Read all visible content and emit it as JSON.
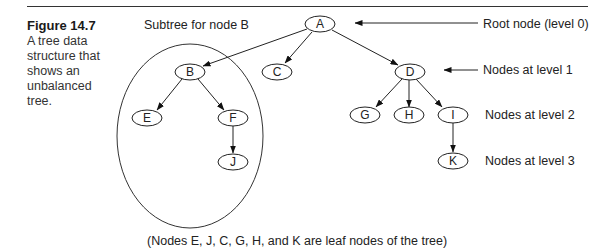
{
  "figure": {
    "number": "Figure 14.7",
    "caption": "A tree data structure that shows an unbalanced tree."
  },
  "diagram": {
    "subtree_label": "Subtree for node B",
    "nodes": [
      {
        "id": "A",
        "label": "A",
        "level": 0
      },
      {
        "id": "B",
        "label": "B",
        "level": 1
      },
      {
        "id": "C",
        "label": "C",
        "level": 1
      },
      {
        "id": "D",
        "label": "D",
        "level": 1
      },
      {
        "id": "E",
        "label": "E",
        "level": 2
      },
      {
        "id": "F",
        "label": "F",
        "level": 2
      },
      {
        "id": "G",
        "label": "G",
        "level": 2
      },
      {
        "id": "H",
        "label": "H",
        "level": 2
      },
      {
        "id": "I",
        "label": "I",
        "level": 2
      },
      {
        "id": "J",
        "label": "J",
        "level": 3
      },
      {
        "id": "K",
        "label": "K",
        "level": 3
      }
    ],
    "edges": [
      [
        "A",
        "B"
      ],
      [
        "A",
        "C"
      ],
      [
        "A",
        "D"
      ],
      [
        "B",
        "E"
      ],
      [
        "B",
        "F"
      ],
      [
        "F",
        "J"
      ],
      [
        "D",
        "G"
      ],
      [
        "D",
        "H"
      ],
      [
        "D",
        "I"
      ],
      [
        "I",
        "K"
      ]
    ],
    "level_labels": {
      "root": "Root node (level 0)",
      "level1": "Nodes at level 1",
      "level2": "Nodes at level 2",
      "level3": "Nodes at level 3"
    },
    "footnote": "(Nodes E, J, C, G, H, and K are leaf nodes of the tree)"
  }
}
